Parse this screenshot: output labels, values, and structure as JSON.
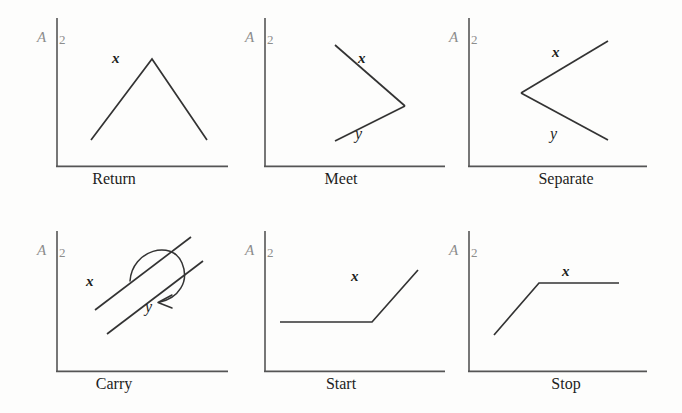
{
  "figure": {
    "background_color": "#fdfdfc",
    "stroke_color": "#333333",
    "axis_color": "#555555",
    "axis_label_color": "#8d8d8d",
    "caption_color": "#1d1d1d",
    "columns": 3,
    "rows": 2,
    "panel_count": 6
  },
  "axis": {
    "name_label": "A",
    "tick_label": "2"
  },
  "panels": [
    {
      "id": "return",
      "caption": "Return",
      "curves": [
        {
          "name": "x",
          "label": "x",
          "label_x": 60,
          "label_y": 30,
          "points": "34,135 95,54 150,135"
        }
      ],
      "annotations": []
    },
    {
      "id": "meet",
      "caption": "Meet",
      "curves": [
        {
          "name": "x",
          "label": "x",
          "label_x": 88,
          "label_y": 25,
          "points": "56,40 126,101"
        },
        {
          "name": "y",
          "label": "y",
          "label_x": 86,
          "label_y": 108,
          "points": "56,136 126,101"
        }
      ],
      "annotations": []
    },
    {
      "id": "separate",
      "caption": "Separate",
      "curves": [
        {
          "name": "x",
          "label": "x",
          "label_x": 72,
          "label_y": 22,
          "points": "52,88 139,36"
        },
        {
          "name": "y",
          "label": "y",
          "label_x": 70,
          "label_y": 108,
          "points": "52,88 139,135"
        }
      ],
      "annotations": []
    },
    {
      "id": "carry",
      "caption": "Carry",
      "curves": [
        {
          "name": "x",
          "label": "x",
          "label_x": 30,
          "label_y": 48,
          "points": "35,105 131,20"
        },
        {
          "name": "y",
          "label": "y",
          "label_x": 93,
          "label_y": 73,
          "points": "47,128 143,43"
        }
      ],
      "annotations": [
        {
          "name": "carry-arrow",
          "kind": "curved-arrow",
          "from": "x",
          "to": "y"
        }
      ]
    },
    {
      "id": "start",
      "caption": "Start",
      "curves": [
        {
          "name": "x",
          "label": "x",
          "label_x": 92,
          "label_y": 37,
          "points": "52,117 144,117 190,65"
        }
      ],
      "annotations": []
    },
    {
      "id": "stop",
      "caption": "Stop",
      "curves": [
        {
          "name": "x",
          "label": "x",
          "label_x": 80,
          "label_y": 22,
          "points": "25,130 70,78 150,78"
        }
      ],
      "annotations": []
    }
  ]
}
